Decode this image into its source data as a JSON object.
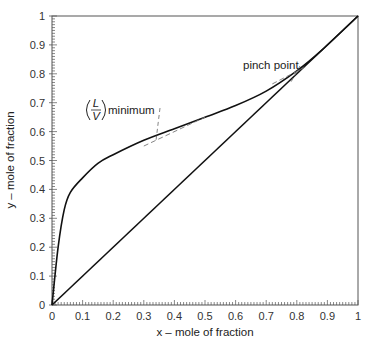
{
  "chart_data": {
    "type": "line",
    "title": "",
    "xlabel": "x – mole of fraction",
    "ylabel": "y – mole of fraction",
    "xlim": [
      0,
      1
    ],
    "ylim": [
      0,
      1
    ],
    "grid": false,
    "legend": null,
    "x_ticks": [
      "0",
      "0.1",
      "0.2",
      "0.3",
      "0.4",
      "0.5",
      "0.6",
      "0.7",
      "0.8",
      "0.9",
      "1"
    ],
    "y_ticks": [
      "0",
      "0.1",
      "0.2",
      "0.3",
      "0.4",
      "0.5",
      "0.6",
      "0.7",
      "0.8",
      "0.9",
      "1"
    ],
    "series": [
      {
        "name": "equilibrium curve",
        "style": "solid",
        "x": [
          0,
          0.02,
          0.04,
          0.06,
          0.1,
          0.15,
          0.2,
          0.3,
          0.4,
          0.5,
          0.6,
          0.7,
          0.8,
          0.88,
          1.0
        ],
        "y": [
          0,
          0.2,
          0.33,
          0.39,
          0.44,
          0.49,
          0.52,
          0.57,
          0.61,
          0.65,
          0.69,
          0.74,
          0.81,
          0.88,
          1.0
        ]
      },
      {
        "name": "diagonal y = x",
        "style": "solid",
        "x": [
          0,
          1
        ],
        "y": [
          0,
          1
        ]
      },
      {
        "name": "(L/V) minimum tangent",
        "style": "dashed",
        "x": [
          0.3,
          0.5
        ],
        "y": [
          0.55,
          0.65
        ]
      },
      {
        "name": "pinch point tangent",
        "style": "dashed",
        "x": [
          0.72,
          0.83
        ],
        "y": [
          0.765,
          0.825
        ]
      }
    ],
    "annotations": [
      {
        "text": "(L/V) minimum",
        "numerator": "L",
        "denominator": "V",
        "suffix": "minimum",
        "x": 0.1,
        "y": 0.64,
        "leader_to": [
          0.34,
          0.57
        ]
      },
      {
        "text": "pinch point",
        "x": 0.6,
        "y": 0.79,
        "leader_to": [
          0.78,
          0.77
        ]
      }
    ]
  },
  "labels": {
    "xlabel": "x – mole of fraction",
    "ylabel": "y – mole of fraction",
    "lv_num": "L",
    "lv_den": "V",
    "lv_suffix": "minimum",
    "pinch": "pinch point"
  }
}
